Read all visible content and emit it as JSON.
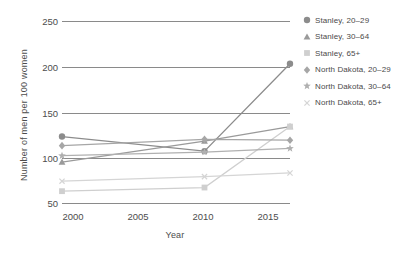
{
  "chart_data": {
    "type": "line",
    "title": "",
    "xlabel": "Year",
    "ylabel": "Number of men per 100 women",
    "xlim": [
      2000,
      2016
    ],
    "ylim": [
      50,
      250
    ],
    "yticks": [
      50,
      100,
      150,
      200,
      250
    ],
    "xticks": [
      2000,
      2005,
      2010,
      2015
    ],
    "grid": true,
    "legend_position": "right",
    "x": [
      2000,
      2010,
      2016
    ],
    "series": [
      {
        "name": "Stanley, 20–29",
        "marker": "circle",
        "color": "#8c8c8c",
        "values": [
          123,
          107,
          203
        ]
      },
      {
        "name": "Stanley, 30–64",
        "marker": "triangle",
        "color": "#9a9a9a",
        "values": [
          95,
          118,
          134
        ]
      },
      {
        "name": "Stanley, 65+",
        "marker": "square",
        "color": "#cfcfcf",
        "values": [
          63,
          67,
          134
        ]
      },
      {
        "name": "North Dakota, 20–29",
        "marker": "diamond",
        "color": "#a6a6a6",
        "values": [
          113,
          120,
          119
        ]
      },
      {
        "name": "North Dakota, 30–64",
        "marker": "star",
        "color": "#b0b0b0",
        "values": [
          102,
          106,
          110
        ]
      },
      {
        "name": "North Dakota, 65+",
        "marker": "x",
        "color": "#d5d5d5",
        "values": [
          74,
          79,
          83
        ]
      }
    ]
  },
  "axis": {
    "ylabel": "Number of men per 100 women",
    "xlabel": "Year",
    "ytick_labels": [
      "250",
      "200",
      "150",
      "100",
      "50"
    ],
    "xtick_labels": [
      "2000",
      "2005",
      "2010",
      "2015"
    ]
  },
  "legend": {
    "items": [
      {
        "label": "Stanley, 20–29"
      },
      {
        "label": "Stanley, 30–64"
      },
      {
        "label": "Stanley, 65+"
      },
      {
        "label": "North Dakota, 20–29"
      },
      {
        "label": "North Dakota, 30–64"
      },
      {
        "label": "North Dakota, 65+"
      }
    ]
  }
}
